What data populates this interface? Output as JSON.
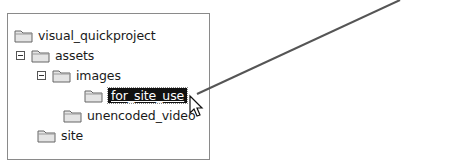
{
  "tree": {
    "nodes": [
      {
        "label": "visual_quickproject",
        "level": 0,
        "expander": false
      },
      {
        "label": "assets",
        "level": 1,
        "expander": "expanded"
      },
      {
        "label": "images",
        "level": 2,
        "expander": "expanded"
      },
      {
        "label": "for_site_use",
        "level": 3,
        "expander": false,
        "selected": true
      },
      {
        "label": "unencoded_video",
        "level": 2,
        "expander": false
      },
      {
        "label": "site",
        "level": 1,
        "expander": false
      }
    ]
  },
  "annotation": {
    "type": "callout-line",
    "color": "#555555"
  },
  "cursor": {
    "icon": "arrow-pointer-icon"
  }
}
